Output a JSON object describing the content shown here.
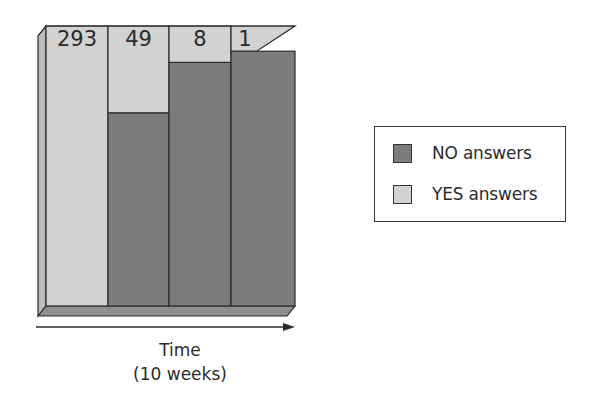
{
  "chart_data": {
    "type": "bar",
    "subtype": "stacked-100-percent-3d",
    "title": "",
    "xlabel": "Time",
    "xlabel_sub": "(10 weeks)",
    "ylabel": "",
    "categories": [
      "293",
      "49",
      "8",
      "1"
    ],
    "category_labels_note": "Numbers printed at top of each column",
    "series": [
      {
        "name": "YES answers",
        "color": "#d2d2d2",
        "values_fraction": [
          1.0,
          0.31,
          0.13,
          0.09
        ]
      },
      {
        "name": "NO answers",
        "color": "#7c7c7c",
        "values_fraction": [
          0.0,
          0.69,
          0.87,
          0.91
        ]
      }
    ],
    "legend": {
      "position": "right",
      "entries": [
        "NO answers",
        "YES answers"
      ]
    },
    "arrow_direction": "right",
    "grid": false
  },
  "legend": {
    "items": [
      {
        "label": "NO answers",
        "color": "#7c7c7c"
      },
      {
        "label": "YES answers",
        "color": "#d2d2d2"
      }
    ]
  },
  "axis": {
    "label": "Time",
    "sublabel": "(10 weeks)"
  },
  "colors": {
    "yes": "#d2d2d2",
    "no": "#7c7c7c",
    "outline": "#2b2b2b",
    "side_dark": "#8f8f8f",
    "side_light": "#bdbdbd"
  }
}
